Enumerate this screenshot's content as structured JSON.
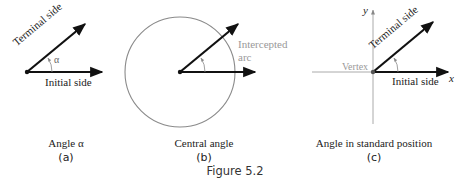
{
  "figure": {
    "caption": "Figure 5.2",
    "panels": [
      {
        "id": "a",
        "title": "Angle α",
        "sub": "(a)",
        "labels": {
          "terminal": "Terminal side",
          "initial": "Initial side",
          "angle": "α"
        }
      },
      {
        "id": "b",
        "title": "Central angle",
        "sub": "(b)",
        "labels": {
          "arc_line1": "Intercepted",
          "arc_line2": "arc"
        }
      },
      {
        "id": "c",
        "title": "Angle in standard position",
        "sub": "(c)",
        "labels": {
          "terminal": "Terminal side",
          "initial": "Initial side",
          "vertex": "Vertex",
          "x_axis": "x",
          "y_axis": "y"
        }
      }
    ]
  },
  "colors": {
    "ink": "#111111",
    "gray": "#999999",
    "circle": "#8a8a8a"
  }
}
